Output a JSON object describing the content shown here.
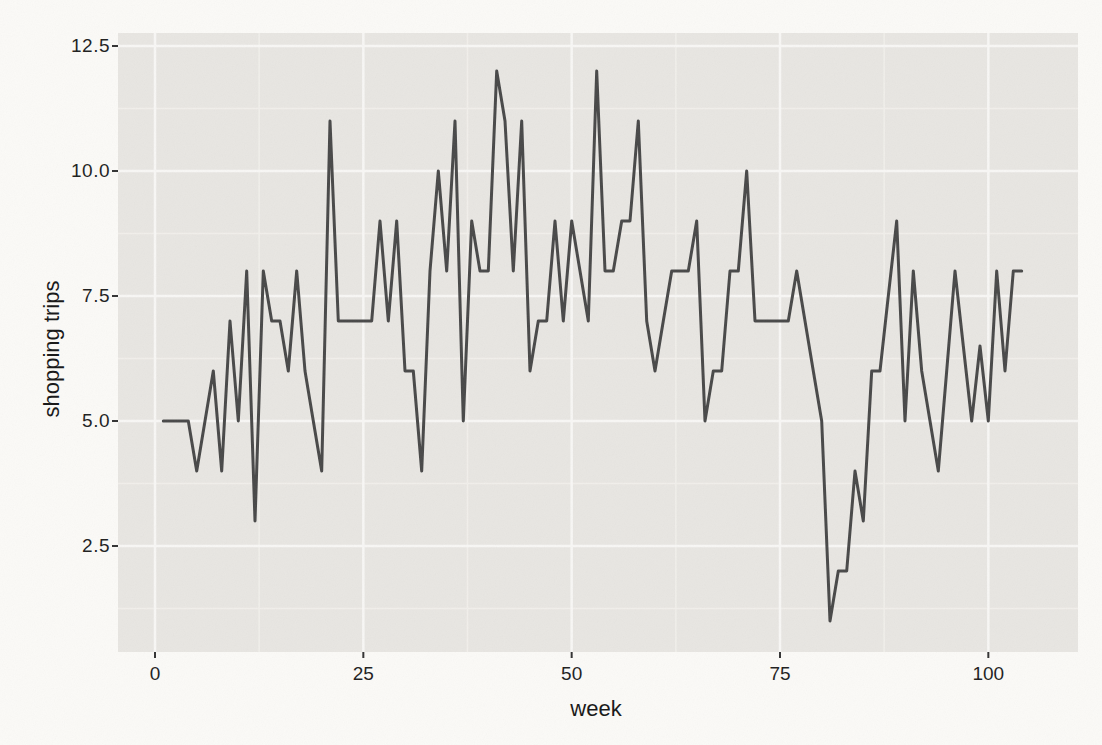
{
  "figure": {
    "background": "#fbfaf7",
    "panel_bg": "#e8e6e2",
    "grid_major_color": "#f8f7f5",
    "grid_minor_color": "#f1efeb",
    "line_color": "#484848",
    "tick_color": "#333333",
    "text_color": "#1e1e1e"
  },
  "chart_data": {
    "type": "line",
    "title": "",
    "xlabel": "week",
    "ylabel": "shopping trips",
    "x_ticks": [
      0,
      25,
      50,
      75,
      100
    ],
    "x_tick_labels": [
      "0",
      "25",
      "50",
      "75",
      "100"
    ],
    "y_ticks": [
      2.5,
      5.0,
      7.5,
      10.0,
      12.5
    ],
    "y_tick_labels": [
      "2.5",
      "5.0",
      "7.5",
      "10.0",
      "12.5"
    ],
    "xlim": [
      -4.44,
      110.76
    ],
    "ylim": [
      0.38,
      12.76
    ],
    "grid": "major-and-minor",
    "legend": "none",
    "week_start": 1,
    "week_step": 1,
    "values": [
      5,
      5,
      5,
      5,
      4,
      5,
      6,
      4,
      7,
      5,
      8,
      3,
      8,
      7,
      7,
      6,
      8,
      6,
      5,
      4,
      11,
      7,
      7,
      7,
      7,
      7,
      9,
      7,
      9,
      6,
      6,
      4,
      8,
      10,
      8,
      11,
      5,
      9,
      8,
      8,
      12,
      11,
      8,
      11,
      6,
      7,
      7,
      9,
      7,
      9,
      8,
      7,
      12,
      8,
      8,
      9,
      9,
      11,
      7,
      6,
      7,
      8,
      8,
      8,
      9,
      5,
      6,
      6,
      8,
      8,
      10,
      7,
      7,
      7,
      7,
      7,
      8,
      7,
      6,
      5,
      1,
      2,
      2,
      4,
      3,
      6,
      6,
      7.5,
      9,
      5,
      8,
      6,
      5,
      4,
      6,
      8,
      6.5,
      5,
      6.5,
      5,
      8,
      6,
      8,
      8
    ]
  }
}
